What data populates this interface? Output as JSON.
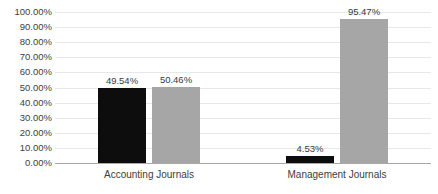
{
  "chart_data": {
    "type": "bar",
    "title": "",
    "subtitle": "",
    "xlabel": "",
    "ylabel": "",
    "ylim": [
      0,
      100
    ],
    "grid": true,
    "legend": "none",
    "categories": [
      "Accounting Journals",
      "Management Journals"
    ],
    "series": [
      {
        "name": "series-1",
        "color": "#0d0d0d",
        "values": [
          49.54,
          4.53
        ],
        "value_labels": [
          "49.54%",
          "4.53%"
        ]
      },
      {
        "name": "series-2",
        "color": "#a6a6a6",
        "values": [
          50.46,
          95.47
        ],
        "value_labels": [
          "50.46%",
          "95.47%"
        ]
      }
    ],
    "ytick_labels": [
      "100.00%",
      "90.00%",
      "80.00%",
      "70.00%",
      "60.00%",
      "50.00%",
      "40.00%",
      "30.00%",
      "20.00%",
      "10.00%",
      "0.00%"
    ],
    "ytick_values": [
      100,
      90,
      80,
      70,
      60,
      50,
      40,
      30,
      20,
      10,
      0
    ]
  },
  "colors": {
    "background": "#ffffff",
    "gridline": "#e8e8e8",
    "axis": "#a8a8a8",
    "text": "#404040",
    "series_1": "#0d0d0d",
    "series_2": "#a6a6a6"
  }
}
